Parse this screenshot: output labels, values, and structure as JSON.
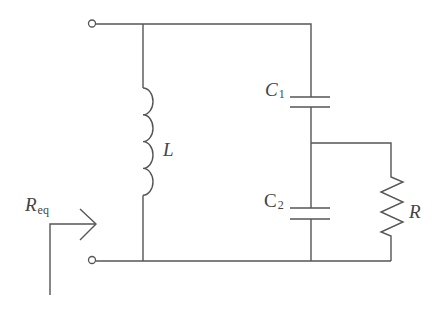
{
  "diagram": {
    "type": "circuit-schematic",
    "components": {
      "inductor": {
        "label": "L"
      },
      "capacitor1": {
        "label": "C",
        "subscript": "1"
      },
      "capacitor2": {
        "label": "C",
        "subscript": "2"
      },
      "resistor": {
        "label": "R"
      }
    },
    "equivalent": {
      "label": "R",
      "subscript": "eq"
    },
    "terminals": [
      "top-terminal",
      "bottom-terminal"
    ],
    "colors": {
      "line": "#555555",
      "text": "#444444",
      "background": "#ffffff"
    }
  }
}
